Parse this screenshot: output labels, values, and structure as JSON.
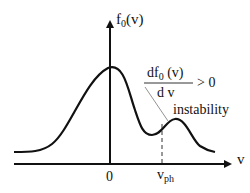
{
  "diagram": {
    "y_axis_label": {
      "main": "f",
      "subscript": "0",
      "arg": "(v)"
    },
    "x_axis_label": "v",
    "origin_label": "0",
    "phase_velocity_label": {
      "main": "v",
      "subscript": "ph"
    },
    "derivative": {
      "numerator": {
        "main": "df",
        "subscript": "0",
        "arg": " (v)"
      },
      "denominator": "d v",
      "relation": "> 0"
    },
    "annotation": "instability",
    "colors": {
      "curve": "#111111",
      "axes": "#111111",
      "pointer": "#777777",
      "background": "#ffffff"
    }
  }
}
